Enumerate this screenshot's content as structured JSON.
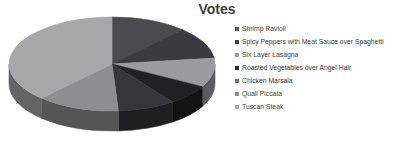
{
  "window": {
    "background": "#ffffff"
  },
  "chart_data": {
    "type": "pie",
    "effect": "3d",
    "title": "Votes",
    "legend_position": "right",
    "categories": [
      "Shrimp Ravioli",
      "Spicy Peppers with Meat Sauce over Spaghetti",
      "Six Layer Lasagna",
      "Roasted Vegetables over Angel Hair",
      "Chicken Marsala",
      "Quail Piccata",
      "Tuscan Steak"
    ],
    "values": [
      12,
      11,
      10,
      7,
      9,
      13,
      38
    ],
    "slice_colors": [
      "#4a4a51",
      "#3a3a41",
      "#9b9ba1",
      "#212127",
      "#36363c",
      "#8d8d93",
      "#a7a7ab"
    ],
    "legend_marker_colors": [
      "#54545b",
      "#41414a",
      "#9d9da3",
      "#2b2b31",
      "#72727a",
      "#8c8c93",
      "#adadb3"
    ],
    "title_color": "#3f3f3f",
    "legend_text_color": "#404040"
  }
}
